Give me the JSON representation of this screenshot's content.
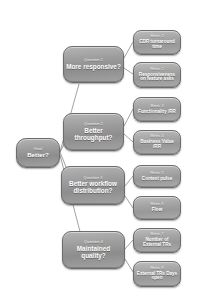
{
  "diagram": {
    "background_color": "#ffffff",
    "node_fill_color": "#9d9d9d",
    "node_border_color": "#6d6d6d",
    "node_text_color": "#ffffff",
    "edge_color": "#7a7a7a"
  },
  "goal": {
    "kicker": "Goal",
    "label": "Better?"
  },
  "questions": [
    {
      "kicker": "Question 1",
      "label": "More responsive?"
    },
    {
      "kicker": "Question 2",
      "label": "Better throughput?"
    },
    {
      "kicker": "Question 3",
      "label": "Better workflow distribution?"
    },
    {
      "kicker": "Question 4",
      "label": "Maintained quality?"
    }
  ],
  "metrics": [
    {
      "kicker": "Metric 1",
      "label": "CDR turnaround time"
    },
    {
      "kicker": "Metric 2",
      "label": "Responsiveness on feature asks"
    },
    {
      "kicker": "Metric 3",
      "label": "Functionality /RR"
    },
    {
      "kicker": "Metric 4",
      "label": "Business Value /RR"
    },
    {
      "kicker": "Metric 5",
      "label": "Context pulse"
    },
    {
      "kicker": "Metric 6",
      "label": "Flow"
    },
    {
      "kicker": "Metric 7",
      "label": "Number of External TRs"
    },
    {
      "kicker": "Metric 8",
      "label": "External TRs Days open"
    }
  ]
}
